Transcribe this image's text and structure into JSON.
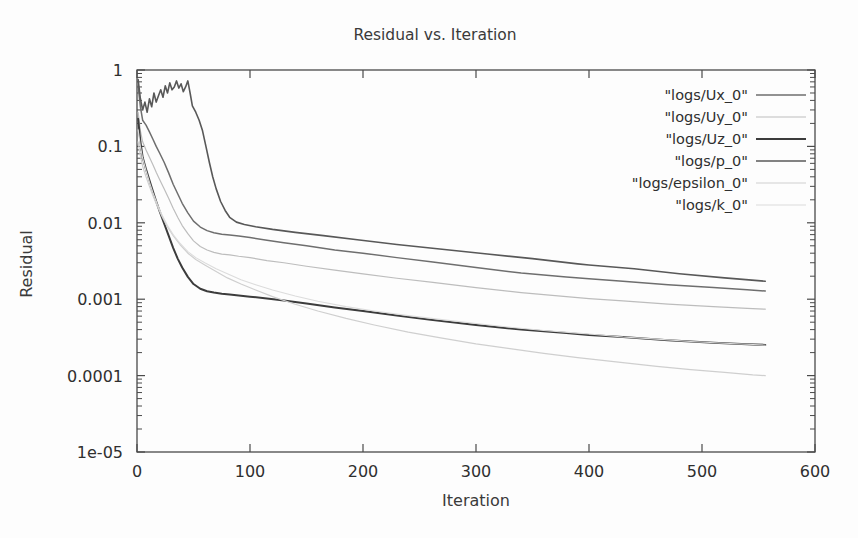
{
  "chart_data": {
    "type": "line",
    "title": "Residual vs. Iteration",
    "xlabel": "Iteration",
    "ylabel": "Residual",
    "xscale": "linear",
    "yscale": "log",
    "xlim": [
      0,
      600
    ],
    "ylim": [
      1e-05,
      1
    ],
    "grid": false,
    "legend_position": "top-right",
    "xticks": [
      0,
      100,
      200,
      300,
      400,
      500,
      600
    ],
    "xtick_labels": [
      "0",
      "100",
      "200",
      "300",
      "400",
      "500",
      "600"
    ],
    "yticks": [
      1,
      0.1,
      0.01,
      0.001,
      0.0001,
      1e-05
    ],
    "ytick_labels": [
      "1",
      "0.1",
      "0.01",
      "0.001",
      "0.0001",
      "1e-05"
    ],
    "series": [
      {
        "name": "\"logs/Ux_0\"",
        "color": "#6e6e6e",
        "width": 1.5,
        "x": [
          1,
          3,
          5,
          8,
          11,
          14,
          17,
          20,
          24,
          28,
          32,
          36,
          40,
          45,
          50,
          56,
          62,
          68,
          75,
          82,
          90,
          100,
          115,
          130,
          150,
          175,
          200,
          230,
          260,
          300,
          340,
          380,
          400,
          430,
          470,
          510,
          540,
          556
        ],
        "y": [
          0.62,
          0.33,
          0.22,
          0.19,
          0.155,
          0.125,
          0.1,
          0.082,
          0.062,
          0.045,
          0.032,
          0.024,
          0.018,
          0.0135,
          0.0105,
          0.0088,
          0.0079,
          0.0074,
          0.0071,
          0.0069,
          0.0067,
          0.0064,
          0.0059,
          0.0055,
          0.005,
          0.0044,
          0.004,
          0.0035,
          0.0031,
          0.0026,
          0.0022,
          0.00195,
          0.00185,
          0.00172,
          0.00155,
          0.00142,
          0.00133,
          0.00128
        ]
      },
      {
        "name": "\"logs/Uy_0\"",
        "color": "#bdbdbd",
        "width": 1.2,
        "x": [
          1,
          3,
          5,
          8,
          11,
          14,
          17,
          20,
          24,
          28,
          32,
          36,
          40,
          45,
          50,
          56,
          62,
          68,
          75,
          82,
          90,
          100,
          115,
          130,
          150,
          175,
          200,
          230,
          260,
          300,
          340,
          380,
          400,
          430,
          470,
          510,
          540,
          556
        ],
        "y": [
          0.28,
          0.16,
          0.115,
          0.09,
          0.072,
          0.058,
          0.046,
          0.037,
          0.028,
          0.021,
          0.0155,
          0.0118,
          0.0092,
          0.0072,
          0.0058,
          0.0049,
          0.0044,
          0.0041,
          0.0039,
          0.0038,
          0.00365,
          0.0035,
          0.0032,
          0.003,
          0.0027,
          0.0024,
          0.00215,
          0.00188,
          0.00167,
          0.00142,
          0.00122,
          0.00108,
          0.00102,
          0.00095,
          0.00086,
          0.0008,
          0.00076,
          0.00074
        ]
      },
      {
        "name": "\"logs/Uz_0\"",
        "color": "#3c3c3c",
        "width": 2.0,
        "x": [
          1,
          3,
          5,
          8,
          11,
          14,
          17,
          20,
          24,
          28,
          32,
          36,
          40,
          45,
          50,
          56,
          62,
          68,
          75,
          82,
          90,
          100,
          115,
          130,
          150,
          175,
          200,
          230,
          260,
          300,
          340,
          380,
          400,
          430,
          470,
          510,
          540,
          556
        ],
        "y": [
          0.23,
          0.115,
          0.072,
          0.05,
          0.036,
          0.026,
          0.019,
          0.0142,
          0.0098,
          0.0068,
          0.0047,
          0.0034,
          0.0026,
          0.00196,
          0.00158,
          0.00137,
          0.00127,
          0.00122,
          0.00118,
          0.00115,
          0.00112,
          0.00108,
          0.00102,
          0.00096,
          0.00088,
          0.00078,
          0.0007,
          0.00061,
          0.00054,
          0.00046,
          0.0004,
          0.00036,
          0.00034,
          0.00032,
          0.00029,
          0.00027,
          0.000258,
          0.000252
        ]
      },
      {
        "name": "\"logs/p_0\"",
        "color": "#585858",
        "width": 1.6,
        "x": [
          1,
          3,
          5,
          7,
          9,
          11,
          13,
          15,
          17,
          19,
          21,
          23,
          25,
          27,
          29,
          31,
          33,
          35,
          37,
          39,
          41,
          43,
          45,
          47,
          49,
          52,
          55,
          58,
          61,
          64,
          67,
          70,
          74,
          78,
          82,
          88,
          95,
          105,
          120,
          140,
          165,
          195,
          230,
          270,
          310,
          350,
          390,
          400,
          440,
          480,
          520,
          556
        ],
        "y": [
          0.75,
          0.42,
          0.3,
          0.38,
          0.28,
          0.42,
          0.33,
          0.5,
          0.38,
          0.46,
          0.55,
          0.44,
          0.62,
          0.5,
          0.68,
          0.55,
          0.6,
          0.72,
          0.58,
          0.66,
          0.52,
          0.6,
          0.72,
          0.5,
          0.34,
          0.28,
          0.22,
          0.16,
          0.1,
          0.062,
          0.04,
          0.028,
          0.019,
          0.0145,
          0.0118,
          0.0102,
          0.0095,
          0.0089,
          0.0082,
          0.0075,
          0.0068,
          0.006,
          0.0052,
          0.0045,
          0.0039,
          0.0034,
          0.0029,
          0.0028,
          0.0025,
          0.00215,
          0.0019,
          0.00172
        ]
      },
      {
        "name": "\"logs/epsilon_0\"",
        "color": "#cfcfcf",
        "width": 1.2,
        "x": [
          1,
          3,
          5,
          8,
          11,
          14,
          18,
          22,
          27,
          32,
          38,
          45,
          52,
          60,
          70,
          80,
          92,
          105,
          120,
          140,
          160,
          185,
          210,
          240,
          270,
          300,
          330,
          360,
          390,
          400,
          430,
          460,
          490,
          520,
          545,
          556
        ],
        "y": [
          0.115,
          0.075,
          0.055,
          0.04,
          0.03,
          0.023,
          0.0165,
          0.0122,
          0.0088,
          0.0068,
          0.0052,
          0.004,
          0.0033,
          0.0028,
          0.0023,
          0.0019,
          0.00158,
          0.00132,
          0.00108,
          0.00086,
          0.0007,
          0.00056,
          0.00046,
          0.00037,
          0.00031,
          0.00026,
          0.000225,
          0.000195,
          0.000172,
          0.000166,
          0.000148,
          0.000132,
          0.00012,
          0.00011,
          0.000102,
          0.0001
        ]
      },
      {
        "name": "\"logs/k_0\"",
        "color": "#dcdcdc",
        "width": 1.1,
        "x": [
          1,
          3,
          5,
          8,
          11,
          14,
          18,
          22,
          27,
          32,
          38,
          45,
          52,
          60,
          70,
          80,
          92,
          105,
          120,
          140,
          160,
          185,
          210,
          240,
          270,
          300,
          330,
          360,
          390,
          400,
          430,
          460,
          490,
          520,
          545,
          556
        ],
        "y": [
          0.165,
          0.1,
          0.07,
          0.048,
          0.034,
          0.025,
          0.0175,
          0.0128,
          0.0092,
          0.007,
          0.0054,
          0.0042,
          0.0035,
          0.003,
          0.0025,
          0.00215,
          0.0018,
          0.00155,
          0.00132,
          0.0011,
          0.00094,
          0.0008,
          0.0007,
          0.00061,
          0.00054,
          0.00048,
          0.00043,
          0.00039,
          0.00036,
          0.00035,
          0.00032,
          0.0003,
          0.00028,
          0.000265,
          0.000255,
          0.00025
        ]
      }
    ]
  },
  "axes": {
    "plot_left": 137,
    "plot_right": 815,
    "plot_top": 70,
    "plot_bottom": 452
  },
  "legend": {
    "entries": [
      {
        "label": "\"logs/Ux_0\"",
        "color": "#6e6e6e",
        "width": 1.5
      },
      {
        "label": "\"logs/Uy_0\"",
        "color": "#bdbdbd",
        "width": 1.2
      },
      {
        "label": "\"logs/Uz_0\"",
        "color": "#3c3c3c",
        "width": 2.0
      },
      {
        "label": "\"logs/p_0\"",
        "color": "#585858",
        "width": 1.6
      },
      {
        "label": "\"logs/epsilon_0\"",
        "color": "#cfcfcf",
        "width": 1.2
      },
      {
        "label": "\"logs/k_0\"",
        "color": "#dcdcdc",
        "width": 1.1
      }
    ]
  }
}
